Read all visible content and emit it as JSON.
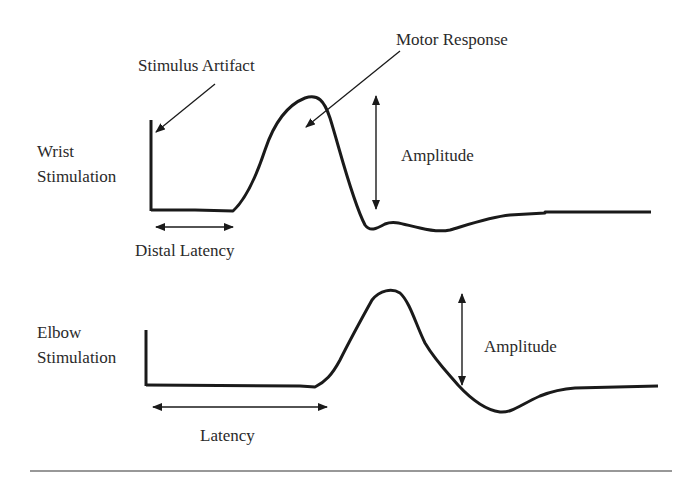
{
  "diagram": {
    "labels": {
      "stimulus_artifact": "Stimulus Artifact",
      "motor_response": "Motor Response",
      "wrist_line1": "Wrist",
      "wrist_line2": "Stimulation",
      "amplitude_top": "Amplitude",
      "distal_latency": "Distal Latency",
      "elbow_line1": "Elbow",
      "elbow_line2": "Stimulation",
      "amplitude_bottom": "Amplitude",
      "latency": "Latency"
    },
    "traces": [
      {
        "name": "Wrist Stimulation",
        "features": [
          "stimulus artifact",
          "baseline",
          "motor response peak",
          "negative trough",
          "return to baseline"
        ]
      },
      {
        "name": "Elbow Stimulation",
        "features": [
          "stimulus artifact",
          "longer baseline (latency)",
          "motor response peak",
          "negative trough",
          "return to baseline"
        ]
      }
    ],
    "colors": {
      "line": "#1a1a1a",
      "background": "#ffffff"
    }
  }
}
